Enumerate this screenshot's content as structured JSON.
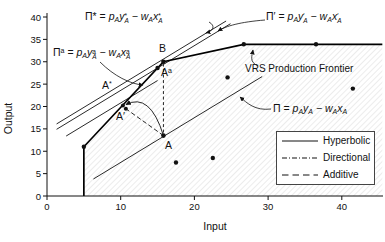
{
  "chart_data": {
    "type": "line",
    "title": "",
    "xlabel": "Input",
    "ylabel": "Output",
    "xlim": [
      0,
      45.5
    ],
    "ylim": [
      0,
      40
    ],
    "xticks": [
      0,
      10,
      20,
      30,
      40
    ],
    "yticks": [
      0,
      5,
      10,
      15,
      20,
      25,
      30,
      35,
      40
    ],
    "grid": false,
    "frontier_label": "VRS Production Frontier",
    "vrs_frontier": [
      [
        5,
        0
      ],
      [
        5,
        11
      ],
      [
        15.8,
        30
      ],
      [
        26.7,
        33.9
      ],
      [
        45.5,
        33.9
      ]
    ],
    "observations": [
      [
        5,
        11
      ],
      [
        17.5,
        7.5
      ],
      [
        22.5,
        8.5
      ],
      [
        24.5,
        26.5
      ],
      [
        26.7,
        33.9
      ],
      [
        36.5,
        33.9
      ],
      [
        41.5,
        24
      ]
    ],
    "key_points": {
      "A": [
        15.8,
        13.5
      ],
      "B": [
        15.8,
        30
      ],
      "A_star": [
        10.3,
        20.2
      ],
      "A_prime": [
        10.7,
        19.5
      ],
      "A_additive": [
        15.0,
        28.6
      ]
    },
    "isoprofit_lines": [
      {
        "id": "pi_star",
        "slope": 1,
        "intercept": 14.8,
        "x_range": [
          1.3,
          24.3
        ]
      },
      {
        "id": "pi_prime",
        "slope": 1,
        "intercept": 13.6,
        "x_range": [
          1.3,
          24.9
        ]
      },
      {
        "id": "pi_add",
        "slope": 1,
        "intercept": 10.8,
        "x_range": [
          2.6,
          15.0
        ]
      },
      {
        "id": "pi",
        "slope": 1,
        "intercept": -2.5,
        "x_range": [
          6.3,
          29.2
        ]
      }
    ],
    "projection_paths": [
      {
        "id": "additive-vertical",
        "from": "A",
        "to": "B",
        "shape": "line",
        "dash": "3,2.5"
      },
      {
        "id": "directional-path",
        "from": "A",
        "to": "A_prime",
        "shape": "line",
        "dash": "4.5,2.5"
      },
      {
        "id": "hyperbolic-arc",
        "from": "A",
        "to": "A_star",
        "shape": "arc",
        "dash": ""
      }
    ],
    "legend": {
      "position": "lower right",
      "entries": [
        {
          "id": "hyperbolic",
          "style": "solid",
          "label": "Hyperbolic"
        },
        {
          "id": "directional",
          "style": "dashdot",
          "label": "Directional"
        },
        {
          "id": "additive",
          "style": "dash",
          "label": "Additive"
        }
      ]
    }
  },
  "annotations": {
    "eq_pi_star": [
      [
        "t",
        "Π* = "
      ],
      [
        "v",
        "p"
      ],
      [
        "sub",
        "A"
      ],
      [
        "v",
        "y"
      ],
      [
        "ss",
        "*",
        "A"
      ],
      [
        "t",
        " − "
      ],
      [
        "v",
        "w"
      ],
      [
        "sub",
        "A"
      ],
      [
        "v",
        "x"
      ],
      [
        "ss",
        "*",
        "A"
      ]
    ],
    "eq_pi_add": [
      [
        "t",
        "Π"
      ],
      [
        "sup",
        "a"
      ],
      [
        "t",
        " = "
      ],
      [
        "v",
        "p"
      ],
      [
        "sub",
        "A"
      ],
      [
        "v",
        "y"
      ],
      [
        "ss",
        "a",
        "A"
      ],
      [
        "t",
        " − "
      ],
      [
        "v",
        "w"
      ],
      [
        "sub",
        "A"
      ],
      [
        "v",
        "x"
      ],
      [
        "ss",
        "a",
        "A"
      ]
    ],
    "eq_pi_prime": [
      [
        "t",
        "Π′ = "
      ],
      [
        "v",
        "p"
      ],
      [
        "sub",
        "A"
      ],
      [
        "v",
        "y"
      ],
      [
        "ss",
        "′",
        "A"
      ],
      [
        "t",
        " − "
      ],
      [
        "v",
        "w"
      ],
      [
        "sub",
        "A"
      ],
      [
        "v",
        "x"
      ],
      [
        "ss",
        "′",
        "A"
      ]
    ],
    "eq_pi": [
      [
        "t",
        "Π = "
      ],
      [
        "v",
        "p"
      ],
      [
        "sub",
        "A"
      ],
      [
        "v",
        "y"
      ],
      [
        "sub",
        "A"
      ],
      [
        "t",
        " − "
      ],
      [
        "v",
        "w"
      ],
      [
        "sub",
        "A"
      ],
      [
        "v",
        "x"
      ],
      [
        "sub",
        "A"
      ]
    ],
    "point_B": [
      [
        "t",
        "B"
      ]
    ],
    "point_A": [
      [
        "t",
        "A"
      ]
    ],
    "point_A_star": [
      [
        "t",
        "A"
      ],
      [
        "sup",
        "*"
      ]
    ],
    "point_A_prime": [
      [
        "t",
        "A′"
      ]
    ],
    "point_A_add": [
      [
        "t",
        "A"
      ],
      [
        "sup",
        "a"
      ]
    ]
  },
  "colors": {
    "ink": "#111111",
    "hatch": "#c9c9c9",
    "frontier": "#000000"
  }
}
